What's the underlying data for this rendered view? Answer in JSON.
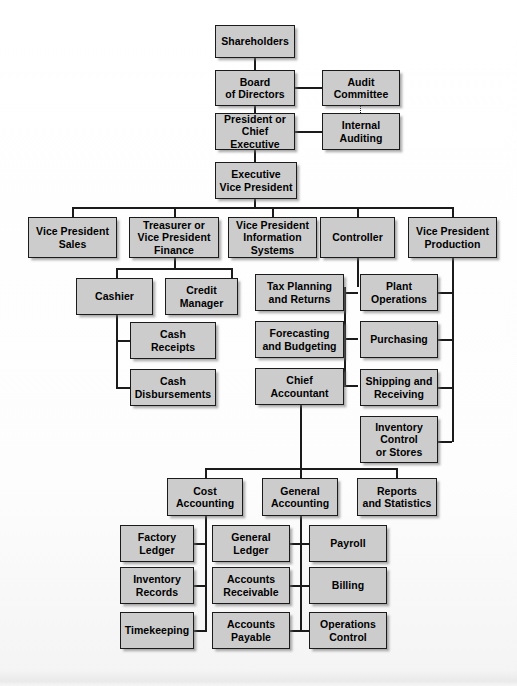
{
  "document": {
    "kind": "organization-chart",
    "title": "Corporate Organization Chart"
  },
  "nodes": {
    "shareholders": "Shareholders",
    "board_of_directors": "Board\nof Directors",
    "audit_committee": "Audit\nCommittee",
    "president": "President or\nChief Executive",
    "internal_auditing": "Internal\nAuditing",
    "executive_vp": "Executive\nVice President",
    "vp_sales": "Vice President\nSales",
    "treasurer": "Treasurer or\nVice President\nFinance",
    "vp_information_systems": "Vice President\nInformation\nSystems",
    "controller": "Controller",
    "vp_production": "Vice President\nProduction",
    "cashier": "Cashier",
    "credit_manager": "Credit\nManager",
    "cash_receipts": "Cash\nReceipts",
    "cash_disbursements": "Cash\nDisbursements",
    "tax_planning": "Tax Planning\nand Returns",
    "forecasting": "Forecasting\nand Budgeting",
    "chief_accountant": "Chief\nAccountant",
    "plant_operations": "Plant\nOperations",
    "purchasing": "Purchasing",
    "shipping_receiving": "Shipping and\nReceiving",
    "inventory_control": "Inventory\nControl\nor Stores",
    "cost_accounting": "Cost\nAccounting",
    "general_accounting": "General\nAccounting",
    "reports_statistics": "Reports\nand Statistics",
    "factory_ledger": "Factory\nLedger",
    "inventory_records": "Inventory\nRecords",
    "timekeeping": "Timekeeping",
    "general_ledger": "General\nLedger",
    "accounts_receivable": "Accounts\nReceivable",
    "accounts_payable": "Accounts\nPayable",
    "payroll": "Payroll",
    "billing": "Billing",
    "operations_control": "Operations\nControl"
  },
  "style": {
    "box_fill": "#cccccc",
    "box_border": "#1b1b1b",
    "line_color": "#1b1b1b",
    "background": "#ffffff",
    "text_color": "#000000"
  },
  "hierarchy": {
    "root": "shareholders",
    "edges": [
      [
        "shareholders",
        "board_of_directors"
      ],
      [
        "board_of_directors",
        "audit_committee"
      ],
      [
        "board_of_directors",
        "president"
      ],
      [
        "president",
        "internal_auditing"
      ],
      [
        "audit_committee",
        "internal_auditing"
      ],
      [
        "president",
        "executive_vp"
      ],
      [
        "executive_vp",
        "vp_sales"
      ],
      [
        "executive_vp",
        "treasurer"
      ],
      [
        "executive_vp",
        "vp_information_systems"
      ],
      [
        "executive_vp",
        "controller"
      ],
      [
        "executive_vp",
        "vp_production"
      ],
      [
        "treasurer",
        "cashier"
      ],
      [
        "treasurer",
        "credit_manager"
      ],
      [
        "cashier",
        "cash_receipts"
      ],
      [
        "cashier",
        "cash_disbursements"
      ],
      [
        "controller",
        "tax_planning"
      ],
      [
        "controller",
        "forecasting"
      ],
      [
        "controller",
        "chief_accountant"
      ],
      [
        "vp_production",
        "plant_operations"
      ],
      [
        "vp_production",
        "purchasing"
      ],
      [
        "vp_production",
        "shipping_receiving"
      ],
      [
        "vp_production",
        "inventory_control"
      ],
      [
        "chief_accountant",
        "cost_accounting"
      ],
      [
        "chief_accountant",
        "general_accounting"
      ],
      [
        "chief_accountant",
        "reports_statistics"
      ],
      [
        "cost_accounting",
        "factory_ledger"
      ],
      [
        "cost_accounting",
        "inventory_records"
      ],
      [
        "cost_accounting",
        "timekeeping"
      ],
      [
        "general_accounting",
        "general_ledger"
      ],
      [
        "general_accounting",
        "accounts_receivable"
      ],
      [
        "general_accounting",
        "accounts_payable"
      ],
      [
        "general_accounting",
        "payroll"
      ],
      [
        "general_accounting",
        "billing"
      ],
      [
        "general_accounting",
        "operations_control"
      ]
    ]
  }
}
